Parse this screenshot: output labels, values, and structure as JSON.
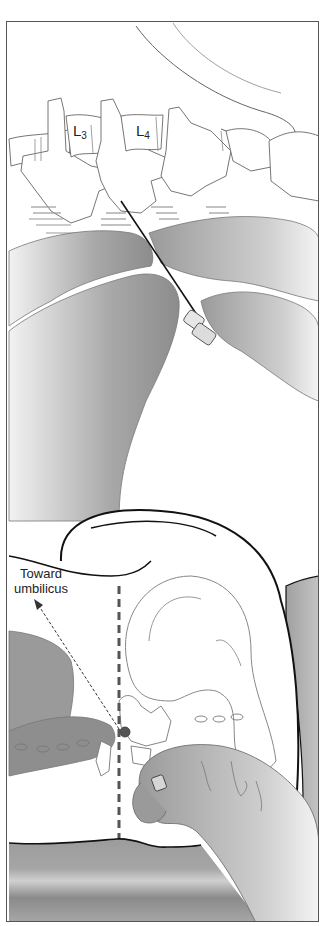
{
  "figure": {
    "upper_panel": {
      "vertebra_labels": [
        {
          "letter": "L",
          "subscript": "3"
        },
        {
          "letter": "L",
          "subscript": "4"
        }
      ]
    },
    "lower_panel": {
      "direction_label_line1": "Toward",
      "direction_label_line2": "umbilicus"
    }
  },
  "colors": {
    "line": "#555555",
    "skin_dark": "#8a8a8a",
    "skin_light": "#e8e8e8",
    "outline_bold": "#111111",
    "midline_dash": "#555555",
    "table": "#9a9a9a"
  }
}
